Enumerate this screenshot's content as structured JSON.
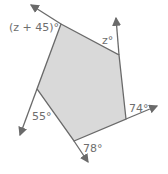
{
  "figure": {
    "type": "pentagon-exterior-angles",
    "fill_color": "#d9d9d9",
    "line_color": "#6a6a6a",
    "labels": {
      "top_left": "(z + 45)°",
      "top_right": "z°",
      "right": "74°",
      "bottom": "78°",
      "left": "55°"
    }
  }
}
